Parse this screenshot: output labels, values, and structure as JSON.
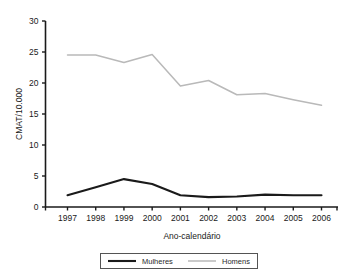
{
  "chart_data": {
    "type": "line",
    "title": "",
    "xlabel": "Ano-calendário",
    "ylabel": "CMAT/10.000",
    "categories": [
      "1997",
      "1998",
      "1999",
      "2000",
      "2001",
      "2002",
      "2003",
      "2004",
      "2005",
      "2006"
    ],
    "x": [
      1997,
      1998,
      1999,
      2000,
      2001,
      2002,
      2003,
      2004,
      2005,
      2006
    ],
    "xlim": [
      1997,
      2006
    ],
    "ylim": [
      0,
      30
    ],
    "yticks": [
      0,
      5,
      10,
      15,
      20,
      25,
      30
    ],
    "ytick_labels": [
      "0",
      "5",
      "10",
      "15",
      "20",
      "25",
      "30"
    ],
    "xtick_labels": [
      "1997",
      "1998",
      "1999",
      "2000",
      "2001",
      "2002",
      "2003",
      "2004",
      "2005",
      "2006"
    ],
    "grid": false,
    "legend_position": "bottom",
    "series": [
      {
        "name": "Mulheres",
        "color": "#1a1a1a",
        "values": [
          1.9,
          3.2,
          4.5,
          3.7,
          1.9,
          1.6,
          1.7,
          2.0,
          1.9,
          1.9
        ]
      },
      {
        "name": "Homens",
        "color": "#b9b9b9",
        "values": [
          24.5,
          24.5,
          23.3,
          24.6,
          19.5,
          20.4,
          18.1,
          18.3,
          17.3,
          16.4
        ]
      }
    ],
    "legend": [
      "Mulheres",
      "Homens"
    ]
  },
  "axes": {
    "y_title": "CMAT/10.000",
    "x_title": "Ano-calendário"
  },
  "legend": {
    "items": [
      {
        "label": "Mulheres",
        "color": "#1a1a1a"
      },
      {
        "label": "Homens",
        "color": "#b9b9b9"
      }
    ]
  }
}
